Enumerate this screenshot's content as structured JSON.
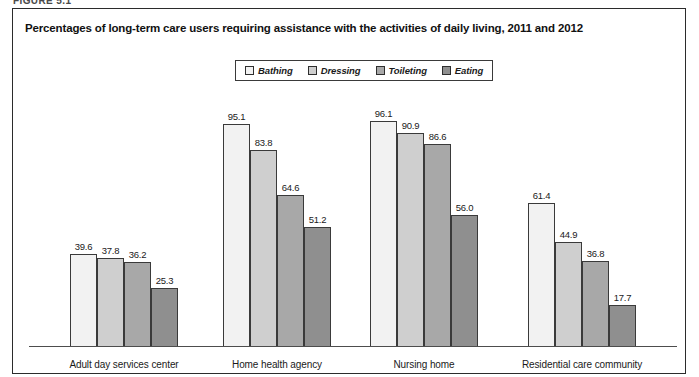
{
  "scan_header": "FIGURE 5.1",
  "figure": {
    "title": "Percentages of long-term care users requiring assistance with the activities of daily living, 2011 and 2012"
  },
  "legend": {
    "items": [
      {
        "label": "Bathing",
        "color": "#f2f2f2"
      },
      {
        "label": "Dressing",
        "color": "#cfcfcf"
      },
      {
        "label": "Toileting",
        "color": "#a8a8a8"
      },
      {
        "label": "Eating",
        "color": "#8f8f8f"
      }
    ]
  },
  "chart_data": {
    "type": "bar",
    "title": "Percentages of long-term care users requiring assistance with the activities of daily living, 2011 and 2012",
    "xlabel": "",
    "ylabel": "",
    "ylim": [
      0,
      100
    ],
    "grid": false,
    "legend_position": "top-center",
    "categories": [
      "Adult day services center",
      "Home health agency",
      "Nursing home",
      "Residential care community"
    ],
    "series": [
      {
        "name": "Bathing",
        "color": "#f2f2f2",
        "values": [
          39.6,
          95.1,
          96.1,
          61.4
        ]
      },
      {
        "name": "Dressing",
        "color": "#cfcfcf",
        "values": [
          37.8,
          83.8,
          90.9,
          44.9
        ]
      },
      {
        "name": "Toileting",
        "color": "#a8a8a8",
        "values": [
          36.2,
          64.6,
          86.6,
          36.8
        ]
      },
      {
        "name": "Eating",
        "color": "#8f8f8f",
        "values": [
          25.3,
          51.2,
          56.0,
          17.7
        ]
      }
    ],
    "data_labels": [
      [
        "39.6",
        "37.8",
        "36.2",
        "25.3"
      ],
      [
        "95.1",
        "83.8",
        "64.6",
        "51.2"
      ],
      [
        "96.1",
        "90.9",
        "86.6",
        "56.0"
      ],
      [
        "61.4",
        "44.9",
        "36.8",
        "17.7"
      ]
    ]
  }
}
